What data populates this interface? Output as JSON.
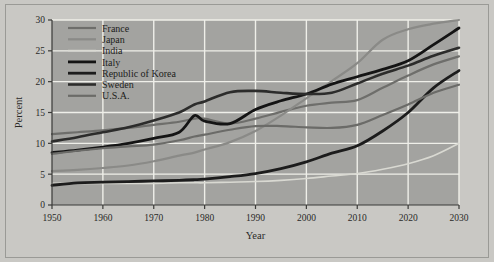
{
  "figure": {
    "background_color": "#c9c8c4",
    "plot_background_color": "#a3a3a0",
    "grid_color": "#efefe9",
    "frame_border_color": "#9a9a96"
  },
  "chart_data": {
    "type": "line",
    "title": "",
    "xlabel": "Year",
    "ylabel": "Percent",
    "xlim": [
      1950,
      2030
    ],
    "ylim": [
      0,
      30
    ],
    "xticks": [
      1950,
      1960,
      1970,
      1980,
      1990,
      2000,
      2010,
      2020,
      2030
    ],
    "yticks": [
      0,
      5,
      10,
      15,
      20,
      25,
      30
    ],
    "grid": true,
    "legend_position": "upper left",
    "x": [
      1950,
      1955,
      1960,
      1965,
      1970,
      1975,
      1978,
      1980,
      1985,
      1990,
      1995,
      2000,
      2005,
      2010,
      2015,
      2020,
      2025,
      2030
    ],
    "series": [
      {
        "name": "France",
        "color": "#6e6e6b",
        "width": 2.2,
        "values": [
          11.5,
          11.8,
          12.1,
          12.5,
          13.0,
          13.5,
          14.0,
          14.0,
          13.2,
          14.0,
          15.1,
          16.1,
          16.6,
          17.0,
          19.0,
          21.0,
          22.8,
          24.1
        ]
      },
      {
        "name": "Japan",
        "color": "#8a8a87",
        "width": 2.2,
        "values": [
          5.5,
          5.7,
          6.0,
          6.4,
          7.1,
          8.0,
          8.5,
          9.0,
          10.2,
          12.0,
          14.5,
          17.3,
          20.1,
          23.0,
          26.8,
          28.5,
          29.4,
          30.0
        ]
      },
      {
        "name": "India",
        "color": "#d9d9d2",
        "width": 1.6,
        "values": [
          3.5,
          3.5,
          3.5,
          3.5,
          3.5,
          3.6,
          3.6,
          3.6,
          3.7,
          3.8,
          4.0,
          4.3,
          4.7,
          5.1,
          5.8,
          6.7,
          8.0,
          10.0
        ]
      },
      {
        "name": "Italy",
        "color": "#141414",
        "width": 2.8,
        "values": [
          8.5,
          8.9,
          9.4,
          10.0,
          10.8,
          11.8,
          14.5,
          13.6,
          13.2,
          15.5,
          16.9,
          18.0,
          19.6,
          20.8,
          22.0,
          23.4,
          26.0,
          28.7
        ]
      },
      {
        "name": "Republic of Korea",
        "color": "#1c1c1c",
        "width": 2.8,
        "values": [
          3.2,
          3.6,
          3.7,
          3.8,
          3.9,
          4.0,
          4.1,
          4.2,
          4.6,
          5.1,
          5.9,
          7.0,
          8.4,
          9.6,
          12.0,
          15.0,
          19.0,
          21.8
        ]
      },
      {
        "name": "Sweden",
        "color": "#2c2c2b",
        "width": 2.6,
        "values": [
          10.3,
          11.0,
          11.8,
          12.6,
          13.7,
          15.0,
          16.3,
          16.8,
          18.3,
          18.5,
          18.2,
          18.0,
          18.2,
          19.7,
          21.3,
          22.6,
          24.2,
          25.5
        ]
      },
      {
        "name": "U.S.A.",
        "color": "#6b6b68",
        "width": 2.2,
        "values": [
          8.3,
          8.8,
          9.2,
          9.5,
          9.8,
          10.5,
          11.1,
          11.4,
          12.2,
          12.8,
          12.8,
          12.6,
          12.5,
          13.0,
          14.6,
          16.3,
          18.2,
          19.5
        ]
      }
    ]
  },
  "legend": {
    "entries": [
      {
        "label": "France"
      },
      {
        "label": "Japan"
      },
      {
        "label": "India"
      },
      {
        "label": "Italy"
      },
      {
        "label": "Republic of Korea"
      },
      {
        "label": "Sweden"
      },
      {
        "label": "U.S.A."
      }
    ]
  }
}
